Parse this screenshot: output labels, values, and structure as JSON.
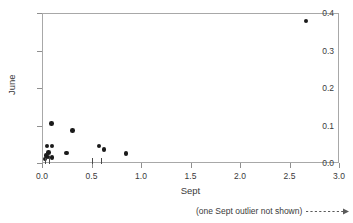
{
  "chart_data": {
    "type": "scatter",
    "title": "",
    "xlabel": "Sept",
    "ylabel": "June",
    "xlim": [
      0.0,
      3.0
    ],
    "ylim": [
      0.0,
      0.4
    ],
    "grid": false,
    "legend": null,
    "x_ticks": [
      {
        "value": 0.0,
        "label": "0.0"
      },
      {
        "value": 0.5,
        "label": "0.5"
      },
      {
        "value": 1.0,
        "label": "1.0"
      },
      {
        "value": 1.5,
        "label": "1.5"
      },
      {
        "value": 2.0,
        "label": "2.0"
      },
      {
        "value": 2.5,
        "label": "2.5"
      },
      {
        "value": 3.0,
        "label": "3.0"
      }
    ],
    "y_ticks": [
      {
        "value": 0.0,
        "label": "0.0"
      },
      {
        "value": 0.1,
        "label": "0.1"
      },
      {
        "value": 0.2,
        "label": "0.2"
      },
      {
        "value": 0.3,
        "label": "0.3"
      },
      {
        "value": 0.4,
        "label": "0.4"
      }
    ],
    "points": [
      {
        "x": 0.02,
        "y": 0.013
      },
      {
        "x": 0.03,
        "y": 0.022
      },
      {
        "x": 0.05,
        "y": 0.019
      },
      {
        "x": 0.04,
        "y": 0.048
      },
      {
        "x": 0.09,
        "y": 0.048
      },
      {
        "x": 0.055,
        "y": 0.031
      },
      {
        "x": 0.09,
        "y": 0.018
      },
      {
        "x": 0.085,
        "y": 0.108
      },
      {
        "x": 0.24,
        "y": 0.029
      },
      {
        "x": 0.3,
        "y": 0.089
      },
      {
        "x": 0.565,
        "y": 0.048
      },
      {
        "x": 0.615,
        "y": 0.038
      },
      {
        "x": 0.84,
        "y": 0.028
      },
      {
        "x": 2.655,
        "y": 0.381
      }
    ],
    "rug_marks_x": [
      0.03,
      0.07,
      0.505,
      0.6
    ],
    "marker_color": "#1a1a1a",
    "frame_color": "#a8a8a8",
    "text_color": "#3a3a3a",
    "annotation": {
      "text": "(one Sept outlier not shown)",
      "arrow_style": "dashed-right-arrow"
    }
  }
}
